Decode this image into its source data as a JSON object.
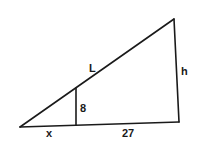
{
  "diagram": {
    "type": "similar right triangles",
    "colors": {
      "stroke": "#1a1a1a",
      "background": "#ffffff"
    },
    "labels": {
      "hypotenuse": "L",
      "height": "h",
      "inner_height": "8",
      "small_base": "x",
      "remaining_base": "27"
    }
  }
}
